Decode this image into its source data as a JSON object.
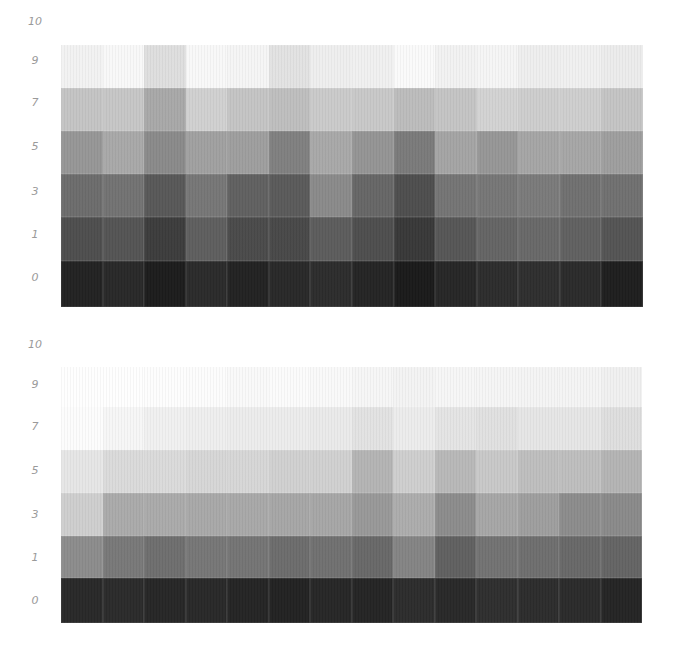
{
  "chart_data": [
    {
      "type": "heatmap",
      "title": "",
      "xlabel": "",
      "ylabel": "",
      "y_tick_labels": [
        "10",
        "9",
        "7",
        "5",
        "3",
        "1",
        "0"
      ],
      "bands": [
        "9",
        "7",
        "5",
        "3",
        "1",
        "0"
      ],
      "columns": 14,
      "gray_values": [
        [
          242,
          248,
          222,
          248,
          245,
          226,
          238,
          240,
          250,
          242,
          245,
          238,
          240,
          236
        ],
        [
          196,
          198,
          168,
          208,
          196,
          190,
          202,
          200,
          188,
          196,
          210,
          205,
          206,
          196
        ],
        [
          150,
          168,
          138,
          160,
          158,
          128,
          168,
          148,
          122,
          164,
          150,
          165,
          166,
          158
        ],
        [
          108,
          114,
          88,
          118,
          96,
          90,
          138,
          102,
          78,
          116,
          118,
          122,
          112,
          112
        ],
        [
          78,
          84,
          60,
          94,
          74,
          72,
          92,
          78,
          56,
          86,
          100,
          104,
          96,
          84
        ],
        [
          34,
          40,
          28,
          42,
          34,
          40,
          44,
          36,
          26,
          38,
          44,
          46,
          42,
          30
        ]
      ]
    },
    {
      "type": "heatmap",
      "title": "",
      "xlabel": "",
      "ylabel": "",
      "y_tick_labels": [
        "10",
        "9",
        "7",
        "5",
        "3",
        "1",
        "0"
      ],
      "bands": [
        "9",
        "7",
        "5",
        "3",
        "1",
        "0"
      ],
      "columns": 14,
      "gray_values": [
        [
          254,
          254,
          253,
          252,
          249,
          251,
          249,
          246,
          243,
          246,
          245,
          244,
          244,
          240
        ],
        [
          252,
          246,
          240,
          238,
          236,
          236,
          234,
          226,
          236,
          228,
          224,
          230,
          230,
          222
        ],
        [
          230,
          218,
          218,
          214,
          214,
          208,
          208,
          180,
          206,
          184,
          200,
          190,
          190,
          180
        ],
        [
          206,
          170,
          170,
          168,
          168,
          166,
          166,
          152,
          172,
          140,
          166,
          158,
          140,
          138
        ],
        [
          140,
          120,
          110,
          118,
          116,
          108,
          112,
          104,
          132,
          96,
          114,
          110,
          104,
          100
        ],
        [
          40,
          42,
          38,
          40,
          36,
          34,
          38,
          36,
          44,
          40,
          46,
          44,
          42,
          36
        ]
      ]
    }
  ]
}
